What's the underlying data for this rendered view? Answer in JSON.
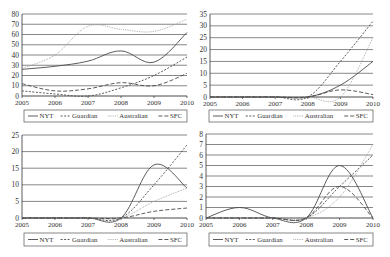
{
  "chart_data": [
    {
      "type": "line",
      "title": "",
      "xlabel": "",
      "ylabel": "",
      "x": [
        2005,
        2006,
        2007,
        2008,
        2009,
        2010
      ],
      "x_tick_labels": [
        "2005",
        "2006",
        "2007",
        "2008",
        "2009",
        "2010"
      ],
      "ylim": [
        0,
        80
      ],
      "y_ticks": [
        0,
        10,
        20,
        30,
        40,
        50,
        60,
        70,
        80
      ],
      "grid": true,
      "legend_position": "bottom",
      "series": [
        {
          "name": "NYT",
          "style": "solid",
          "values": [
            26,
            29,
            34,
            44,
            33,
            62
          ]
        },
        {
          "name": "Guardian",
          "style": "dashed",
          "values": [
            5,
            2,
            0,
            8,
            20,
            38
          ]
        },
        {
          "name": "Australian",
          "style": "dotted",
          "values": [
            27,
            40,
            68,
            65,
            63,
            75
          ]
        },
        {
          "name": "SFC",
          "style": "long-dash",
          "values": [
            12,
            5,
            7,
            13,
            10,
            22
          ]
        }
      ]
    },
    {
      "type": "line",
      "title": "",
      "xlabel": "",
      "ylabel": "",
      "x": [
        2005,
        2006,
        2007,
        2008,
        2009,
        2010
      ],
      "x_tick_labels": [
        "2005",
        "2006",
        "2007",
        "2008",
        "2009",
        "2010"
      ],
      "ylim": [
        0,
        35
      ],
      "y_ticks": [
        0,
        5,
        10,
        15,
        20,
        25,
        30,
        35
      ],
      "grid": true,
      "legend_position": "bottom",
      "series": [
        {
          "name": "NYT",
          "style": "solid",
          "values": [
            0,
            0,
            0,
            0,
            5,
            15
          ]
        },
        {
          "name": "Guardian",
          "style": "dashed",
          "values": [
            0,
            0,
            0,
            0,
            15,
            32
          ]
        },
        {
          "name": "Australian",
          "style": "dotted",
          "values": [
            0,
            0,
            0,
            0,
            0,
            25
          ]
        },
        {
          "name": "SFC",
          "style": "long-dash",
          "values": [
            0,
            0,
            0,
            0,
            3,
            1
          ]
        }
      ]
    },
    {
      "type": "line",
      "title": "",
      "xlabel": "",
      "ylabel": "",
      "x": [
        2005,
        2006,
        2007,
        2008,
        2009,
        2010
      ],
      "x_tick_labels": [
        "2005",
        "2006",
        "2007",
        "2008",
        "2009",
        "2010"
      ],
      "ylim": [
        0,
        25
      ],
      "y_ticks": [
        0,
        5,
        10,
        15,
        20,
        25
      ],
      "grid": true,
      "legend_position": "bottom",
      "series": [
        {
          "name": "NYT",
          "style": "solid",
          "values": [
            0,
            0,
            0,
            0,
            16,
            9
          ]
        },
        {
          "name": "Guardian",
          "style": "dashed",
          "values": [
            0,
            0,
            0,
            0,
            10,
            22
          ]
        },
        {
          "name": "Australian",
          "style": "dotted",
          "values": [
            0,
            0,
            0,
            0,
            5,
            9
          ]
        },
        {
          "name": "SFC",
          "style": "long-dash",
          "values": [
            0,
            0,
            0,
            0,
            2,
            3
          ]
        }
      ]
    },
    {
      "type": "line",
      "title": "",
      "xlabel": "",
      "ylabel": "",
      "x": [
        2005,
        2006,
        2007,
        2008,
        2009,
        2010
      ],
      "x_tick_labels": [
        "2005",
        "2006",
        "2007",
        "2008",
        "2009",
        "2010"
      ],
      "ylim": [
        0,
        8
      ],
      "y_ticks": [
        0,
        1,
        2,
        3,
        4,
        5,
        6,
        7,
        8
      ],
      "grid": true,
      "legend_position": "bottom",
      "series": [
        {
          "name": "NYT",
          "style": "solid",
          "values": [
            0,
            1,
            0,
            0,
            5,
            0
          ]
        },
        {
          "name": "Guardian",
          "style": "dashed",
          "values": [
            0,
            0,
            0,
            0,
            3,
            6
          ]
        },
        {
          "name": "Australian",
          "style": "dotted",
          "values": [
            0,
            0,
            0,
            0,
            2,
            7
          ]
        },
        {
          "name": "SFC",
          "style": "long-dash",
          "values": [
            0,
            0,
            0,
            0,
            3,
            0
          ]
        }
      ]
    }
  ]
}
